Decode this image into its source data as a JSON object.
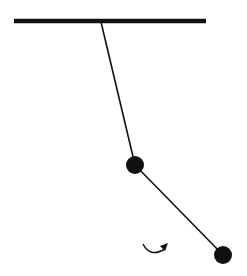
{
  "diagram": {
    "type": "double-pendulum",
    "colors": {
      "ink": "#111111",
      "background": "#ffffff"
    },
    "ceiling": {
      "x1": 14,
      "x2": 206,
      "y": 21,
      "thickness": 4.5
    },
    "pivot": {
      "x": 101,
      "y": 22
    },
    "bob1": {
      "x": 135,
      "y": 165,
      "r": 9
    },
    "bob2": {
      "x": 223,
      "y": 255,
      "r": 9
    },
    "rod_width": 1.6,
    "rotation_indicator": {
      "direction": "counterclockwise",
      "icon": "curved-arrow-icon"
    }
  }
}
